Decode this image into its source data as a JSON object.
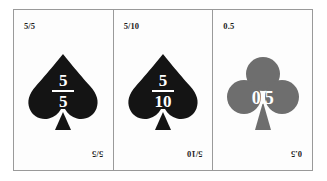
{
  "figure": {
    "name": "equivalent-value-playing-cards",
    "border_color": "#9a9a9a",
    "background_color": "#ffffff",
    "card_face_color": "#fdfdfd"
  },
  "cards": [
    {
      "id": "card-1",
      "corner_top_label": "5/5",
      "corner_bottom_label": "5/5",
      "suit_icon": "spade-icon",
      "suit_name": "spade",
      "suit_color": "#141414",
      "value_kind": "fraction",
      "numerator": "5",
      "denominator": "5",
      "value_text": "5/5"
    },
    {
      "id": "card-2",
      "corner_top_label": "5/10",
      "corner_bottom_label": "5/10",
      "suit_icon": "spade-icon",
      "suit_name": "spade",
      "suit_color": "#141414",
      "value_kind": "fraction",
      "numerator": "5",
      "denominator": "10",
      "value_text": "5/10"
    },
    {
      "id": "card-3",
      "corner_top_label": "0.5",
      "corner_bottom_label": "0.5",
      "suit_icon": "club-icon",
      "suit_name": "club",
      "suit_color": "#6e6e6e",
      "value_kind": "decimal",
      "decimal": "0.5",
      "value_text": "0.5"
    }
  ]
}
